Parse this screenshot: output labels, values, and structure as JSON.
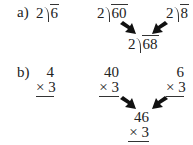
{
  "part_a": {
    "label": "a)",
    "left": {
      "divisor": "2",
      "dividend": "6"
    },
    "middle": {
      "divisor": "2",
      "dividend": "60"
    },
    "right": {
      "divisor": "2",
      "dividend": "8"
    },
    "result": {
      "divisor": "2",
      "dividend": "68"
    }
  },
  "part_b": {
    "label": "b)",
    "left": {
      "top": "4",
      "bottom": "× 3"
    },
    "middle": {
      "top": "40",
      "bottom": "× 3"
    },
    "right": {
      "top": "6",
      "bottom": "× 3"
    },
    "result": {
      "top": "46",
      "bottom": "× 3"
    }
  },
  "arrow_color": "#111111"
}
